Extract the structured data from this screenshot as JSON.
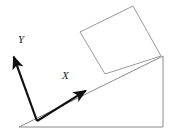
{
  "figure": {
    "background_color": "#ffffff",
    "width": 173,
    "height": 140,
    "labels": {
      "x_axis": "X",
      "y_axis": "Y"
    },
    "colors": {
      "outline": "#8a8a8a",
      "block_outline": "#9a9a9a",
      "axis_arrow": "#111111",
      "label_text": "#1a1a1a"
    },
    "shapes": {
      "incline_triangle": {
        "name": "inclined-plane",
        "points": "19,127 163,127 163,56",
        "stroke_width": 1
      },
      "block_square": {
        "name": "block-on-incline",
        "points": "133,6 161,56 105,74 80,32",
        "stroke_width": 1
      }
    },
    "axes": {
      "origin": {
        "x": 37,
        "y": 121
      },
      "x_arrow": {
        "tip_x": 90,
        "tip_y": 88
      },
      "y_arrow": {
        "tip_x": 12,
        "tip_y": 52
      },
      "arrow_stroke_width": 2.2
    }
  }
}
